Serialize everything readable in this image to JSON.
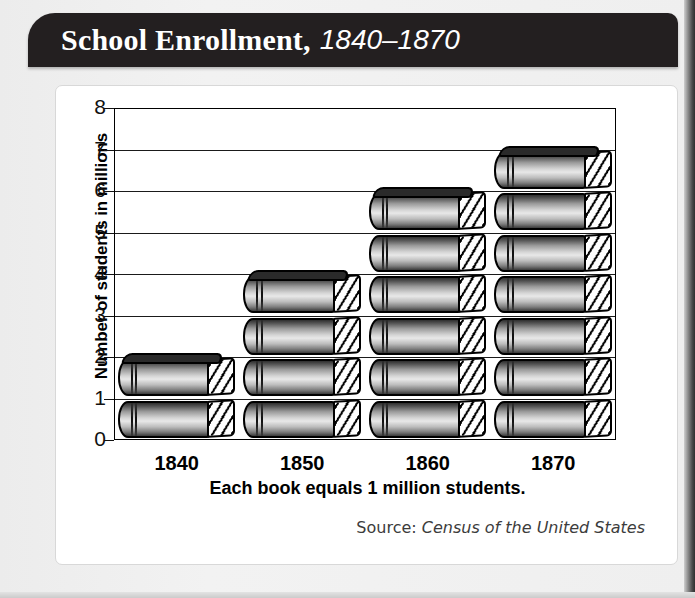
{
  "title": {
    "main": "School Enrollment,",
    "range": "1840–1870"
  },
  "chart_data": {
    "type": "bar",
    "title": "School Enrollment, 1840–1870",
    "categories": [
      "1840",
      "1850",
      "1860",
      "1870"
    ],
    "values": [
      2,
      4,
      6,
      7
    ],
    "xlabel": "",
    "ylabel": "Number of students in millions",
    "ylim": [
      0,
      8
    ],
    "ytick_labels": [
      "0",
      "1",
      "2",
      "3",
      "4",
      "5",
      "6",
      "7",
      "8"
    ],
    "grid": true,
    "legend": "none",
    "unit_note": "Each book equals 1 million students.",
    "pictograph_icon": "book-icon",
    "units": "millions of students"
  },
  "axis": {
    "y_title": "Number of students in millions",
    "y_ticks": [
      "8",
      "7",
      "6",
      "5",
      "4",
      "3",
      "2",
      "1",
      "0"
    ],
    "x_labels": [
      "1840",
      "1850",
      "1860",
      "1870"
    ]
  },
  "caption": "Each book equals 1 million students.",
  "source": {
    "label": "Source:",
    "title": "Census of the United States"
  },
  "colors": {
    "banner": "#231f20",
    "banner_text": "#ffffff",
    "card": "#ffffff",
    "page_background": "#ececec",
    "axis": "#000000",
    "source_text": "#3c3c3c"
  }
}
